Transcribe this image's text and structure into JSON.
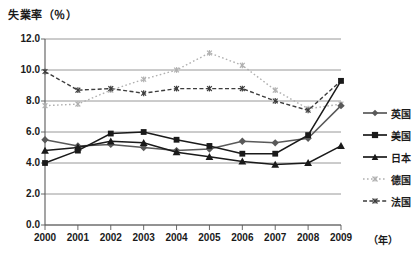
{
  "chart_data": {
    "type": "line",
    "title": "失業率（％）",
    "xlabel": "（年）",
    "ylabel": "失業率（％）",
    "x": [
      2000,
      2001,
      2002,
      2003,
      2004,
      2005,
      2006,
      2007,
      2008,
      2009
    ],
    "categories": [
      "2000",
      "2001",
      "2002",
      "2003",
      "2004",
      "2005",
      "2006",
      "2007",
      "2008",
      "2009"
    ],
    "ytick_labels": [
      "0.0",
      "2.0",
      "4.0",
      "6.0",
      "8.0",
      "10.0",
      "12.0"
    ],
    "ytick_values": [
      0.0,
      2.0,
      4.0,
      6.0,
      8.0,
      10.0,
      12.0
    ],
    "ylim": [
      0.0,
      12.0
    ],
    "xlim": [
      2000,
      2009
    ],
    "grid": true,
    "legend_position": "right",
    "series": [
      {
        "name": "英国",
        "marker": "diamond",
        "line_style": "solid",
        "color": "#595959",
        "values": [
          5.5,
          5.1,
          5.2,
          5.0,
          4.8,
          4.9,
          5.4,
          5.3,
          5.6,
          7.7
        ]
      },
      {
        "name": "美国",
        "marker": "square",
        "line_style": "solid",
        "color": "#1a1a1a",
        "values": [
          4.0,
          4.8,
          5.9,
          6.0,
          5.5,
          5.1,
          4.6,
          4.6,
          5.8,
          9.3
        ]
      },
      {
        "name": "日本",
        "marker": "triangle",
        "line_style": "solid",
        "color": "#1a1a1a",
        "values": [
          4.8,
          5.0,
          5.4,
          5.3,
          4.7,
          4.4,
          4.1,
          3.9,
          4.0,
          5.1
        ]
      },
      {
        "name": "德国",
        "marker": "star",
        "line_style": "dotted",
        "color": "#b0b0b0",
        "values": [
          7.7,
          7.8,
          8.7,
          9.4,
          10.0,
          11.1,
          10.3,
          8.7,
          7.5,
          7.8
        ]
      },
      {
        "name": "法国",
        "marker": "star",
        "line_style": "dashed",
        "color": "#3d3d3d",
        "values": [
          9.9,
          8.7,
          8.8,
          8.5,
          8.8,
          8.8,
          8.8,
          8.0,
          7.4,
          9.3
        ]
      }
    ]
  },
  "legend": {
    "items": [
      {
        "label": "英国"
      },
      {
        "label": "美国"
      },
      {
        "label": "日本"
      },
      {
        "label": "德国"
      },
      {
        "label": "法国"
      }
    ]
  }
}
